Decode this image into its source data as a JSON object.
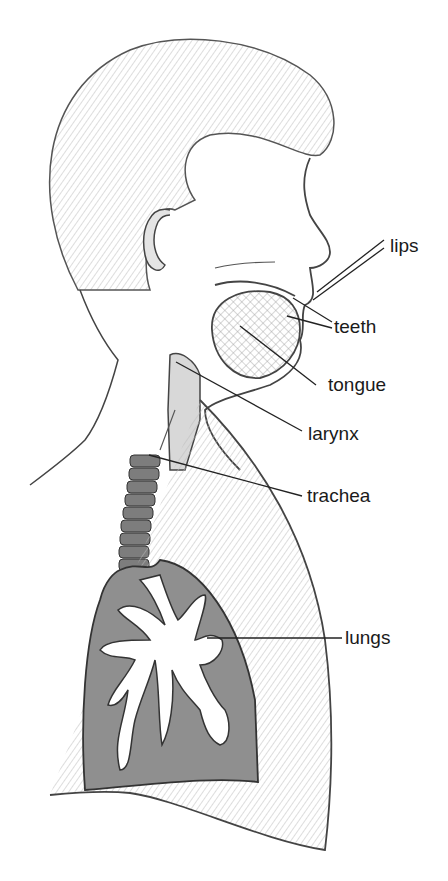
{
  "diagram": {
    "labels": [
      {
        "id": "lips",
        "text": "lips",
        "x": 390,
        "y": 236
      },
      {
        "id": "teeth",
        "text": "teeth",
        "x": 334,
        "y": 317
      },
      {
        "id": "tongue",
        "text": "tongue",
        "x": 328,
        "y": 375
      },
      {
        "id": "larynx",
        "text": "larynx",
        "x": 308,
        "y": 424
      },
      {
        "id": "trachea",
        "text": "trachea",
        "x": 307,
        "y": 486
      },
      {
        "id": "lungs",
        "text": "lungs",
        "x": 345,
        "y": 630
      }
    ],
    "colors": {
      "line": "#222222",
      "shading_dark": "#8a8a8a",
      "shading_light": "#d6d6d6",
      "background": "#ffffff"
    }
  }
}
